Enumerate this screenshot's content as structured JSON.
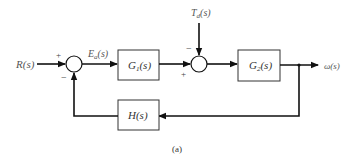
{
  "diagram": {
    "type": "block-diagram",
    "caption": "(a)",
    "signals": {
      "input": "R(s)",
      "error": "E",
      "error_sub": "a",
      "error_arg": "(s)",
      "disturbance": "T",
      "disturbance_sub": "d",
      "disturbance_arg": "(s)",
      "output": "ω(s)"
    },
    "blocks": {
      "g1": {
        "name": "G",
        "sub": "1",
        "arg": "(s)"
      },
      "g2": {
        "name": "G",
        "sub": "2",
        "arg": "(s)"
      },
      "h": {
        "label": "H(s)"
      }
    },
    "summers": {
      "s1": {
        "plus": "+",
        "minus": "−"
      },
      "s2": {
        "plus": "+",
        "minus": "−"
      }
    }
  }
}
